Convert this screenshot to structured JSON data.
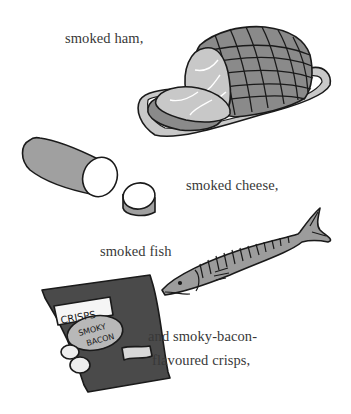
{
  "page": {
    "captions": {
      "ham": "smoked ham,",
      "cheese": "smoked cheese,",
      "fish": "smoked fish",
      "crisps_line1": "and smoky-bacon-",
      "crisps_line2": "flavoured crisps,"
    },
    "crisps_packet": {
      "brand_label": "CRISPS",
      "flavour_line1": "SMOKY",
      "flavour_line2": "BACON"
    },
    "illustrations": [
      "ham-on-platter",
      "cheese-log-with-slice",
      "fish",
      "crisps-packet"
    ],
    "colors": {
      "background": "#ffffff",
      "outline": "#1a1a1a",
      "ham_skin": "#8a8a8a",
      "ham_meat": "#c8c8c8",
      "platter": "#c9c9c9",
      "cheese_rind": "#a0a0a0",
      "fish": "#9c9c9c",
      "packet": "#4a4a4a"
    }
  }
}
